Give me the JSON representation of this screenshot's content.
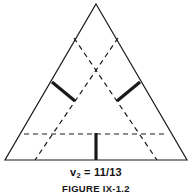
{
  "figure": {
    "background_color": "#ffffff",
    "ink_color": "#1a1a1a",
    "value_label": {
      "variable": "v",
      "subscript": "2",
      "equals": "=",
      "value": "11/13",
      "full_text": "v2 = 11/13"
    },
    "caption": "FIGURE IX-1.2"
  },
  "chart_data": {
    "type": "diagram",
    "title": "",
    "subtitle": "",
    "annotations": [
      {
        "name": "value-annotation",
        "text": "v2 = 11/13",
        "x": 96,
        "y": 172
      },
      {
        "name": "caption-annotation",
        "text": "FIGURE IX-1.2",
        "x": 96,
        "y": 189
      }
    ],
    "shapes": [
      {
        "name": "outer-triangle",
        "kind": "polygon",
        "style": "solid",
        "stroke_width": 1.2,
        "points": [
          [
            96,
            4
          ],
          [
            187,
            160
          ],
          [
            5,
            160
          ]
        ]
      },
      {
        "name": "dashed-diagonal-left",
        "kind": "line",
        "style": "dashed",
        "stroke_width": 1.2,
        "points": [
          [
            74,
            38
          ],
          [
            157,
            160
          ]
        ]
      },
      {
        "name": "dashed-diagonal-right",
        "kind": "line",
        "style": "dashed",
        "stroke_width": 1.2,
        "points": [
          [
            118,
            38
          ],
          [
            35,
            160
          ]
        ]
      },
      {
        "name": "dashed-horizontal",
        "kind": "line",
        "style": "dashed",
        "stroke_width": 1.2,
        "points": [
          [
            24,
            134
          ],
          [
            168,
            134
          ]
        ]
      },
      {
        "name": "thick-segment-left",
        "kind": "line",
        "style": "solid-thick",
        "stroke_width": 3.2,
        "points": [
          [
            52,
            82
          ],
          [
            75,
            101
          ]
        ]
      },
      {
        "name": "thick-segment-right",
        "kind": "line",
        "style": "solid-thick",
        "stroke_width": 3.2,
        "points": [
          [
            140,
            82
          ],
          [
            117,
            101
          ]
        ]
      },
      {
        "name": "thick-segment-center",
        "kind": "line",
        "style": "solid-thick",
        "stroke_width": 3.2,
        "points": [
          [
            96,
            133
          ],
          [
            96,
            160
          ]
        ]
      }
    ],
    "xlabel": "",
    "ylabel": "",
    "grid": false,
    "legend": null
  }
}
